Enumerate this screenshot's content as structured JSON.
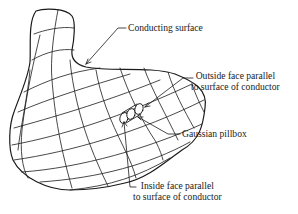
{
  "diagram": {
    "labels": {
      "conducting_surface": "Conducting surface",
      "outside_face_line1": "Outside face parallel",
      "outside_face_line2": "to surface of conductor",
      "gaussian_pillbox": "Gaussian pillbox",
      "inside_face_line1": "Inside face parallel",
      "inside_face_line2": "to surface of conductor"
    },
    "colors": {
      "stroke": "#1a1a1a",
      "background": "#ffffff"
    }
  }
}
